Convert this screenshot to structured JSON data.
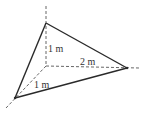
{
  "diagram": {
    "type": "3d-tetrahedron",
    "colors": {
      "solid_edge": "#2a2a2a",
      "dashed_axis": "#555555",
      "label": "#333333",
      "background": "#ffffff"
    },
    "labels": {
      "height": "1 m",
      "length": "2 m",
      "depth": "1 m"
    },
    "vertices": {
      "origin": [
        46,
        66
      ],
      "top": [
        46,
        23
      ],
      "right": [
        127,
        68
      ],
      "bottom_left": [
        15,
        98
      ]
    }
  }
}
